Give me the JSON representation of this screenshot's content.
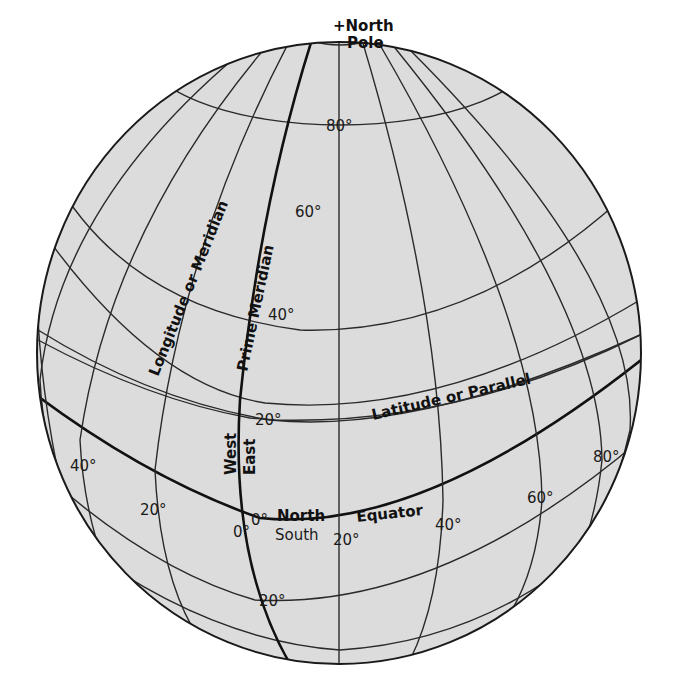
{
  "colors": {
    "globe_fill": "#dcdcdc",
    "line": "#2a2a2a",
    "background": "#ffffff"
  },
  "labels": {
    "north_pole": "+North",
    "pole": "Pole",
    "longitude": "Longitude or Meridian",
    "prime_meridian": "Prime Meridian",
    "latitude": "Latitude or Parallel",
    "equator": "Equator",
    "west": "West",
    "east": "East",
    "north": "North",
    "south": "South"
  },
  "latitude_ticks": {
    "lat80": "80°",
    "lat60": "60°",
    "lat40": "40°",
    "lat20n": "20°",
    "lat0": "0°",
    "lat20s": "20°"
  },
  "longitude_ticks": {
    "lon40w": "40°",
    "lon20w": "20°",
    "lon0": "0°",
    "lon20e": "20°",
    "lon40e": "40°",
    "lon60e": "60°",
    "lon80e": "80°"
  }
}
